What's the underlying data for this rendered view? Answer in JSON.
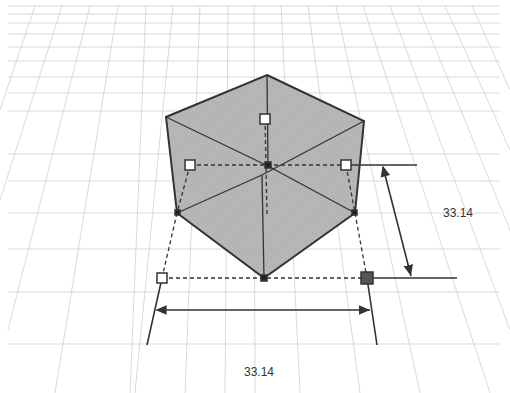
{
  "scene": {
    "background": "#ffffff",
    "grid_color": "#c8c8c8",
    "shape": {
      "type": "cube",
      "fill": "#b4b4b4",
      "edge_color": "#333333"
    },
    "handles": {
      "hollow_color": "#ffffff",
      "selected_color": "#555555"
    }
  },
  "dimensions": {
    "height_label": "33.14",
    "width_label": "33.14"
  }
}
